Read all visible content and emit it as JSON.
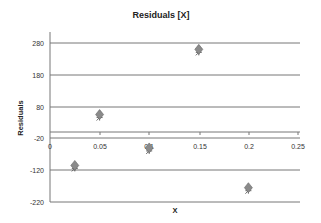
{
  "chart_data": {
    "type": "scatter",
    "title": "Residuals [X]",
    "xlabel": "X",
    "ylabel": "Residuals",
    "xlim": [
      0,
      0.25
    ],
    "ylim": [
      -220,
      280
    ],
    "x_ticks": [
      "0",
      "0.05",
      "0.1",
      "0.15",
      "0.2",
      "0.25"
    ],
    "y_ticks": [
      "280",
      "180",
      "80",
      "-20",
      "-120",
      "-220"
    ],
    "grid": true,
    "legend": null,
    "series": [
      {
        "name": "Residuals",
        "marker": "diamond",
        "color": "#8a8a8a",
        "x": [
          0.025,
          0.05,
          0.1,
          0.15,
          0.2
        ],
        "y": [
          -105,
          55,
          -50,
          260,
          -175
        ]
      }
    ]
  }
}
